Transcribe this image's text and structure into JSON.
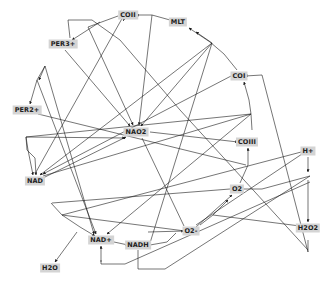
{
  "diagram": {
    "type": "directed-network",
    "nodes": [
      {
        "id": "COII",
        "label": "COII",
        "x": 128,
        "y": 15
      },
      {
        "id": "MLT",
        "label": "MLT",
        "x": 178,
        "y": 22
      },
      {
        "id": "PER3",
        "label": "PER3+",
        "x": 63,
        "y": 44
      },
      {
        "id": "COI",
        "label": "COI",
        "x": 239,
        "y": 76
      },
      {
        "id": "PER2",
        "label": "PER2+",
        "x": 27,
        "y": 110
      },
      {
        "id": "NAO2",
        "label": "NAO2",
        "x": 136,
        "y": 132
      },
      {
        "id": "COIII",
        "label": "COIII",
        "x": 247,
        "y": 142
      },
      {
        "id": "HPLUS",
        "label": "H+",
        "x": 308,
        "y": 151
      },
      {
        "id": "NAD",
        "label": "NAD",
        "x": 35,
        "y": 181
      },
      {
        "id": "O2",
        "label": "O2",
        "x": 237,
        "y": 189
      },
      {
        "id": "H2O2",
        "label": "H2O2",
        "x": 308,
        "y": 228
      },
      {
        "id": "O2M",
        "label": "O2-",
        "x": 191,
        "y": 231
      },
      {
        "id": "NADP",
        "label": "NAD+",
        "x": 101,
        "y": 240
      },
      {
        "id": "NADH",
        "label": "NADH",
        "x": 138,
        "y": 245
      },
      {
        "id": "H2O",
        "label": "H2O",
        "x": 50,
        "y": 268
      }
    ],
    "edges": [
      {
        "path": "M 152 15 L 136 15",
        "arrow": true
      },
      {
        "path": "M 170 20 L 152 15",
        "arrow": false
      },
      {
        "path": "M 100 22 L 72 40",
        "arrow": true
      },
      {
        "path": "M 88 27 L 118 16",
        "arrow": false
      },
      {
        "path": "M 45 66 L 37 80 L 30 104",
        "arrow": true
      },
      {
        "path": "M 45 66 L 39 80",
        "arrow": true
      },
      {
        "path": "M 26 137 L 28 150 L 33 175",
        "arrow": true
      },
      {
        "path": "M 26 137 L 27 150 L 35 158 L 36 175",
        "arrow": true
      },
      {
        "path": "M 51 203 L 62 215 L 80 227 L 95 236",
        "arrow": true
      },
      {
        "path": "M 114 242 L 128 245",
        "arrow": true
      },
      {
        "path": "M 150 245 L 167 242 L 176 233",
        "arrow": false
      },
      {
        "path": "M 148 232 L 184 231",
        "arrow": true
      },
      {
        "path": "M 196 227 L 232 195",
        "arrow": true
      },
      {
        "path": "M 200 225 L 213 215 L 228 200",
        "arrow": true
      },
      {
        "path": "M 240 183 L 248 165 L 248 148",
        "arrow": true
      },
      {
        "path": "M 252 130 L 251 114 L 249 100 L 244 82",
        "arrow": true
      },
      {
        "path": "M 237 70 L 224 54 L 210 42 L 189 28",
        "arrow": true
      },
      {
        "path": "M 212 43 L 196 32",
        "arrow": true
      },
      {
        "path": "M 308 157 L 308 172",
        "arrow": true
      },
      {
        "path": "M 308 180 L 308 222",
        "arrow": true
      },
      {
        "path": "M 308 240 L 308 252",
        "arrow": false
      },
      {
        "path": "M 77 232 L 55 262",
        "arrow": true
      },
      {
        "path": "M 70 38 L 68 20 L 92 20 L 120 40 L 180 110 L 308 250",
        "arrow": false
      },
      {
        "path": "M 308 252 L 262 75 L 245 76",
        "arrow": true
      },
      {
        "path": "M 138 250 L 138 269 L 165 269 L 310 176",
        "arrow": false
      },
      {
        "path": "M 101 260 L 101 264 L 125 264 L 310 182",
        "arrow": false
      },
      {
        "path": "M 101 262 L 101 246",
        "arrow": true
      },
      {
        "path": "M 233 75 L 43 174",
        "arrow": true
      },
      {
        "path": "M 212 43 L 40 175",
        "arrow": true
      },
      {
        "path": "M 152 15 L 139 125",
        "arrow": true
      },
      {
        "path": "M 212 43 L 141 126",
        "arrow": true
      },
      {
        "path": "M 88 27 L 133 125",
        "arrow": true
      },
      {
        "path": "M 65 50 L 130 126",
        "arrow": true
      },
      {
        "path": "M 36 172 L 124 15",
        "arrow": false
      },
      {
        "path": "M 124 20 L 123 18",
        "arrow": true
      },
      {
        "path": "M 150 132 L 238 142",
        "arrow": true
      },
      {
        "path": "M 142 138 L 184 226",
        "arrow": false
      },
      {
        "path": "M 38 114 L 246 165",
        "arrow": false
      },
      {
        "path": "M 26 137 L 125 138",
        "arrow": true
      },
      {
        "path": "M 26 137 L 251 114",
        "arrow": false
      },
      {
        "path": "M 43 176 L 251 114",
        "arrow": false
      },
      {
        "path": "M 43 178 L 126 137",
        "arrow": true
      },
      {
        "path": "M 52 203 L 230 189",
        "arrow": false
      },
      {
        "path": "M 62 215 L 185 231",
        "arrow": false
      },
      {
        "path": "M 213 215 L 300 226",
        "arrow": true
      },
      {
        "path": "M 212 43 L 150 243",
        "arrow": false
      },
      {
        "path": "M 37 80 L 96 234",
        "arrow": true
      },
      {
        "path": "M 45 66 L 94 234",
        "arrow": true
      },
      {
        "path": "M 251 114 L 107 234",
        "arrow": true
      },
      {
        "path": "M 243 189 L 262 189 L 310 176",
        "arrow": false
      },
      {
        "path": "M 62 215 L 305 151",
        "arrow": false
      },
      {
        "path": "M 196 225 L 302 154",
        "arrow": false
      }
    ]
  },
  "colors": {
    "node_fill": "#d4d4d4",
    "edge": "#1a1a1a",
    "background": "#ffffff"
  }
}
